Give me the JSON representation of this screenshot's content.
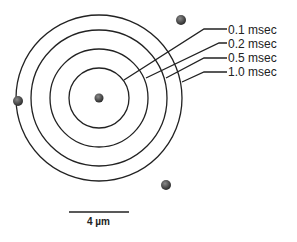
{
  "diagram": {
    "center": {
      "x": 99,
      "y": 98
    },
    "rings": [
      {
        "label": "0.1 msec",
        "radius": 30
      },
      {
        "label": "0.2 msec",
        "radius": 49
      },
      {
        "label": "0.5 msec",
        "radius": 68
      },
      {
        "label": "1.0 msec",
        "radius": 83
      }
    ],
    "particles": [
      {
        "x": 99,
        "y": 98,
        "r": 4.5
      },
      {
        "x": 181,
        "y": 20,
        "r": 5
      },
      {
        "x": 18,
        "y": 101,
        "r": 5
      },
      {
        "x": 166,
        "y": 185,
        "r": 5
      }
    ],
    "scale_bar": {
      "label": "4 µm"
    }
  }
}
